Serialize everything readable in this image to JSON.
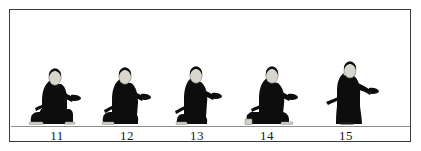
{
  "figure": {
    "title": "",
    "background_color": "#ffffff",
    "border_color": "#3a3a3a",
    "ground_line_color": "#8d8d8d",
    "silhouette_color": "#0d0d0d",
    "head_color": "#d9d6ce",
    "head_outline_color": "#8a8780",
    "panel_count": 5
  },
  "panels": [
    {
      "label": "11",
      "pose": "kneeling-low-arm-extended-forward",
      "x": 21,
      "description": "Figure kneeling on one knee, torso upright, right arm extended forward holding object, sword at hip"
    },
    {
      "label": "12",
      "pose": "kneeling-rising-arm-forward",
      "x": 91,
      "description": "Figure rising from kneel, one knee down, arm extended forward, sword at hip"
    },
    {
      "label": "13",
      "pose": "kneeling-mid-rise-arm-forward",
      "x": 161,
      "description": "Figure mid-rise from kneel, arm extended forward, sword at hip"
    },
    {
      "label": "14",
      "pose": "seated-crouch-arm-forward",
      "x": 231,
      "description": "Figure low crouch/seated, body horizontal mass, arm extended forward, sword at hip"
    },
    {
      "label": "15",
      "pose": "standing-upright-arm-forward",
      "x": 310,
      "description": "Figure standing fully upright in long robe, arm extended forward, sword at hip"
    }
  ]
}
